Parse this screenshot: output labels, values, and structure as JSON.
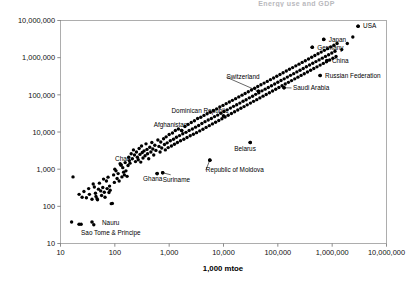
{
  "title": {
    "text": "Energy use and GDP",
    "clipped": true
  },
  "axis_title_x": "1,000 mtoe",
  "chart_data": {
    "type": "scatter",
    "title": "Energy use and GDP",
    "xlabel": "1,000 mtoe",
    "ylabel": "",
    "xscale": "log",
    "yscale": "log",
    "xlim": [
      10,
      10000000
    ],
    "ylim": [
      10,
      10000000
    ],
    "grid": false,
    "legend": null,
    "xticks": [
      "10",
      "100",
      "1,000",
      "10,000",
      "100,000",
      "1,000,000",
      "10,000,000"
    ],
    "yticks": [
      "10",
      "100",
      "1,000",
      "10,000",
      "100,000",
      "1,000,000",
      "10,000,000"
    ],
    "marker": "filled-circle",
    "marker_color": "#000000",
    "annotations": [
      {
        "label": "USA",
        "x": 3000000,
        "y": 7000000,
        "dx": 5,
        "dy": 2.2,
        "leader": false
      },
      {
        "label": "Japan",
        "x": 700000,
        "y": 3100000,
        "dx": 5,
        "dy": 2.2,
        "leader": false
      },
      {
        "label": "Germany",
        "x": 430000,
        "y": 1900000,
        "dx": 5,
        "dy": 2.2,
        "leader": false
      },
      {
        "label": "China",
        "x": 800000,
        "y": 830000,
        "dx": 5,
        "dy": 2.2,
        "leader": false
      },
      {
        "label": "Russian Federation",
        "x": 600000,
        "y": 330000,
        "dx": 5,
        "dy": 2.2,
        "leader": false
      },
      {
        "label": "Saudi Arabia",
        "x": 130000,
        "y": 155000,
        "dx": 9,
        "dy": 2.2,
        "leader": true,
        "arrow": "left"
      },
      {
        "label": "Switzerland",
        "x": 44000,
        "y": 125000,
        "dx": -32,
        "dy": -12,
        "leader": true
      },
      {
        "label": "Dominican Republic",
        "x": 10000,
        "y": 27000,
        "dx": -52,
        "dy": -3,
        "leader": false
      },
      {
        "label": "Afghanistan",
        "x": 1700,
        "y": 11000,
        "dx": -28,
        "dy": -3,
        "leader": false
      },
      {
        "label": "Belarus",
        "x": 31000,
        "y": 5200,
        "dx": -16,
        "dy": 8,
        "leader": false
      },
      {
        "label": "Republic of Moldova",
        "x": 5600,
        "y": 1750,
        "dx": -4,
        "dy": 12,
        "leader": true
      },
      {
        "label": "Chad",
        "x": 130,
        "y": 1300,
        "dx": -6,
        "dy": -4,
        "leader": false
      },
      {
        "label": "Ghana",
        "x": 600,
        "y": 760,
        "dx": -14,
        "dy": 7,
        "leader": false
      },
      {
        "label": "Suriname",
        "x": 760,
        "y": 800,
        "dx": 0,
        "dy": 9,
        "leader": true,
        "arrow": "up"
      },
      {
        "label": "Nauru",
        "x": 38,
        "y": 38,
        "dx": 10,
        "dy": 3,
        "leader": false
      },
      {
        "label": "Sao Tome & Principe",
        "x": 22,
        "y": 33,
        "dx": 2,
        "dy": 11,
        "leader": false
      }
    ],
    "points": [
      [
        16,
        38
      ],
      [
        24,
        33
      ],
      [
        41,
        32
      ],
      [
        17,
        620
      ],
      [
        22,
        210
      ],
      [
        25,
        175
      ],
      [
        27,
        250
      ],
      [
        30,
        170
      ],
      [
        33,
        300
      ],
      [
        34,
        210
      ],
      [
        38,
        155
      ],
      [
        40,
        400
      ],
      [
        42,
        330
      ],
      [
        44,
        225
      ],
      [
        45,
        185
      ],
      [
        47,
        160
      ],
      [
        48,
        150
      ],
      [
        50,
        290
      ],
      [
        52,
        420
      ],
      [
        55,
        260
      ],
      [
        57,
        195
      ],
      [
        60,
        320
      ],
      [
        62,
        540
      ],
      [
        64,
        240
      ],
      [
        66,
        175
      ],
      [
        70,
        480
      ],
      [
        72,
        300
      ],
      [
        75,
        610
      ],
      [
        78,
        235
      ],
      [
        80,
        350
      ],
      [
        82,
        270
      ],
      [
        86,
        118
      ],
      [
        90,
        120
      ],
      [
        95,
        700
      ],
      [
        98,
        440
      ],
      [
        100,
        1000
      ],
      [
        105,
        900
      ],
      [
        110,
        560
      ],
      [
        115,
        760
      ],
      [
        120,
        480
      ],
      [
        125,
        1400
      ],
      [
        130,
        1300
      ],
      [
        135,
        620
      ],
      [
        140,
        1100
      ],
      [
        145,
        830
      ],
      [
        150,
        700
      ],
      [
        155,
        1500
      ],
      [
        160,
        900
      ],
      [
        168,
        640
      ],
      [
        175,
        1250
      ],
      [
        180,
        2100
      ],
      [
        185,
        1700
      ],
      [
        190,
        1450
      ],
      [
        200,
        2600
      ],
      [
        210,
        1900
      ],
      [
        220,
        3300
      ],
      [
        230,
        2400
      ],
      [
        240,
        1600
      ],
      [
        250,
        2900
      ],
      [
        260,
        2100
      ],
      [
        270,
        1800
      ],
      [
        280,
        3600
      ],
      [
        290,
        2500
      ],
      [
        300,
        1550
      ],
      [
        310,
        4200
      ],
      [
        320,
        2800
      ],
      [
        330,
        2000
      ],
      [
        345,
        3100
      ],
      [
        360,
        2300
      ],
      [
        375,
        4800
      ],
      [
        390,
        3400
      ],
      [
        400,
        2600
      ],
      [
        420,
        1900
      ],
      [
        440,
        3900
      ],
      [
        460,
        2900
      ],
      [
        480,
        5200
      ],
      [
        500,
        3500
      ],
      [
        520,
        2400
      ],
      [
        545,
        4400
      ],
      [
        570,
        3200
      ],
      [
        600,
        760
      ],
      [
        620,
        6100
      ],
      [
        650,
        4100
      ],
      [
        680,
        2900
      ],
      [
        700,
        5400
      ],
      [
        730,
        3700
      ],
      [
        760,
        800
      ],
      [
        790,
        6600
      ],
      [
        820,
        4600
      ],
      [
        850,
        3300
      ],
      [
        880,
        7400
      ],
      [
        920,
        5100
      ],
      [
        960,
        3800
      ],
      [
        1000,
        8600
      ],
      [
        1050,
        5800
      ],
      [
        1100,
        4200
      ],
      [
        1150,
        9400
      ],
      [
        1200,
        6400
      ],
      [
        1250,
        4700
      ],
      [
        1300,
        11000
      ],
      [
        1360,
        7200
      ],
      [
        1420,
        5200
      ],
      [
        1480,
        12000
      ],
      [
        1550,
        8000
      ],
      [
        1620,
        5800
      ],
      [
        1700,
        11000
      ],
      [
        1780,
        9000
      ],
      [
        1860,
        6400
      ],
      [
        1950,
        14000
      ],
      [
        2040,
        9800
      ],
      [
        2130,
        7100
      ],
      [
        2230,
        16000
      ],
      [
        2330,
        11000
      ],
      [
        2440,
        7900
      ],
      [
        2550,
        18000
      ],
      [
        2670,
        12000
      ],
      [
        2790,
        8700
      ],
      [
        2920,
        20000
      ],
      [
        3050,
        13500
      ],
      [
        3190,
        9600
      ],
      [
        3340,
        23000
      ],
      [
        3490,
        15000
      ],
      [
        3650,
        10700
      ],
      [
        3820,
        25000
      ],
      [
        4000,
        17000
      ],
      [
        4180,
        11900
      ],
      [
        4370,
        28000
      ],
      [
        4570,
        19000
      ],
      [
        4780,
        13300
      ],
      [
        5000,
        31000
      ],
      [
        5230,
        21000
      ],
      [
        5470,
        14800
      ],
      [
        5600,
        1750
      ],
      [
        5720,
        34000
      ],
      [
        5980,
        23000
      ],
      [
        6250,
        16500
      ],
      [
        6540,
        38000
      ],
      [
        6840,
        26000
      ],
      [
        7150,
        18300
      ],
      [
        7480,
        42000
      ],
      [
        7820,
        28500
      ],
      [
        8180,
        20400
      ],
      [
        8550,
        47000
      ],
      [
        8940,
        32000
      ],
      [
        9350,
        22700
      ],
      [
        9780,
        52000
      ],
      [
        10000,
        27000
      ],
      [
        10200,
        35500
      ],
      [
        10700,
        25300
      ],
      [
        11200,
        58000
      ],
      [
        11700,
        39500
      ],
      [
        12200,
        28200
      ],
      [
        12800,
        64000
      ],
      [
        13400,
        44000
      ],
      [
        14000,
        31400
      ],
      [
        14600,
        71000
      ],
      [
        15300,
        49000
      ],
      [
        16000,
        35000
      ],
      [
        16700,
        79000
      ],
      [
        17500,
        54000
      ],
      [
        18300,
        39000
      ],
      [
        19100,
        88000
      ],
      [
        20000,
        60000
      ],
      [
        20900,
        43400
      ],
      [
        21900,
        98000
      ],
      [
        22900,
        67000
      ],
      [
        23900,
        48300
      ],
      [
        25000,
        109000
      ],
      [
        26100,
        74000
      ],
      [
        27300,
        53800
      ],
      [
        28600,
        121000
      ],
      [
        29900,
        83000
      ],
      [
        31000,
        5200
      ],
      [
        31300,
        59900
      ],
      [
        32700,
        135000
      ],
      [
        34200,
        92000
      ],
      [
        35700,
        66700
      ],
      [
        37400,
        150000
      ],
      [
        39100,
        103000
      ],
      [
        40900,
        74300
      ],
      [
        42700,
        167000
      ],
      [
        44000,
        125000
      ],
      [
        44700,
        114000
      ],
      [
        46700,
        82700
      ],
      [
        48900,
        186000
      ],
      [
        51100,
        128000
      ],
      [
        53400,
        92100
      ],
      [
        55900,
        207000
      ],
      [
        58400,
        142000
      ],
      [
        61100,
        102500
      ],
      [
        63900,
        230000
      ],
      [
        66800,
        158000
      ],
      [
        69900,
        114100
      ],
      [
        73100,
        256000
      ],
      [
        76400,
        176000
      ],
      [
        79900,
        127000
      ],
      [
        83600,
        285000
      ],
      [
        87400,
        196000
      ],
      [
        91400,
        141400
      ],
      [
        95600,
        317000
      ],
      [
        100000,
        218000
      ],
      [
        104600,
        157400
      ],
      [
        109400,
        353000
      ],
      [
        114400,
        242000
      ],
      [
        119600,
        175200
      ],
      [
        125100,
        393000
      ],
      [
        130000,
        155000
      ],
      [
        130800,
        269000
      ],
      [
        136800,
        195000
      ],
      [
        143100,
        437000
      ],
      [
        149600,
        300000
      ],
      [
        156500,
        217000
      ],
      [
        163600,
        486000
      ],
      [
        171100,
        334000
      ],
      [
        179000,
        241500
      ],
      [
        187200,
        541000
      ],
      [
        195800,
        372000
      ],
      [
        204700,
        269000
      ],
      [
        214100,
        602000
      ],
      [
        223900,
        414000
      ],
      [
        234200,
        299000
      ],
      [
        245000,
        670000
      ],
      [
        256200,
        460000
      ],
      [
        268000,
        333000
      ],
      [
        280300,
        745000
      ],
      [
        293100,
        512000
      ],
      [
        306600,
        370000
      ],
      [
        320600,
        829000
      ],
      [
        335300,
        570000
      ],
      [
        350700,
        412000
      ],
      [
        366800,
        922000
      ],
      [
        383600,
        634000
      ],
      [
        401200,
        458000
      ],
      [
        419600,
        1026000
      ],
      [
        430000,
        1900000
      ],
      [
        438800,
        705000
      ],
      [
        459000,
        510000
      ],
      [
        480000,
        1142000
      ],
      [
        502100,
        784000
      ],
      [
        525100,
        567000
      ],
      [
        549200,
        1270000
      ],
      [
        574400,
        872000
      ],
      [
        600000,
        330000
      ],
      [
        600800,
        631000
      ],
      [
        628400,
        1413000
      ],
      [
        657200,
        970000
      ],
      [
        687400,
        701000
      ],
      [
        700000,
        3100000
      ],
      [
        718900,
        1572000
      ],
      [
        751900,
        1080000
      ],
      [
        786300,
        780000
      ],
      [
        800000,
        830000
      ],
      [
        822400,
        1749000
      ],
      [
        860200,
        1201000
      ],
      [
        899700,
        868000
      ],
      [
        941000,
        1946000
      ],
      [
        984200,
        1336000
      ],
      [
        1029400,
        966000
      ],
      [
        1076700,
        2165000
      ],
      [
        1126100,
        1486000
      ],
      [
        1177800,
        1074000
      ],
      [
        1231800,
        2409000
      ],
      [
        1500000,
        1650000
      ],
      [
        1900000,
        2400000
      ],
      [
        2400000,
        3600000
      ],
      [
        3000000,
        7000000
      ]
    ]
  }
}
